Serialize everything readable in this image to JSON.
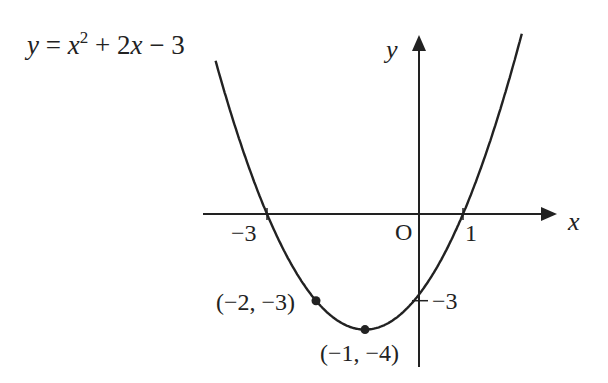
{
  "chart_data": {
    "type": "line",
    "title": "",
    "equation_label": {
      "y": "y",
      "eq": " = ",
      "x1": "x",
      "sup": "2",
      "rest1": " + 2",
      "x2": "x",
      "rest2": " − 3"
    },
    "function": {
      "a": 1,
      "b": 2,
      "c": -3
    },
    "xlabel": "x",
    "ylabel": "y",
    "origin_label": "O",
    "xlim": [
      -4.05,
      2.15
    ],
    "ylim": [
      -4.6,
      6.1
    ],
    "grid": false,
    "x_tick_labels": [
      {
        "value": -3,
        "label": "−3"
      },
      {
        "value": 1,
        "label": "1"
      }
    ],
    "y_tick_labels": [
      {
        "value": -3,
        "label": "−3"
      }
    ],
    "marked_points": [
      {
        "x": -2,
        "y": -3,
        "label": "(−2, −3)"
      },
      {
        "x": -1,
        "y": -4,
        "label": "(−1, −4)"
      }
    ],
    "colors": {
      "ink": "#222222",
      "background": "#ffffff"
    }
  }
}
